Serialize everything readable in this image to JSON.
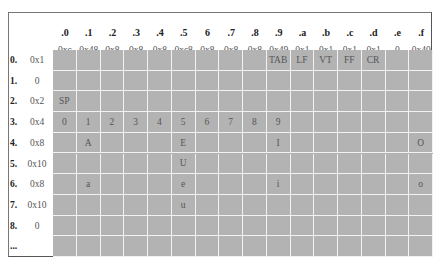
{
  "table": {
    "col_headers": [
      ".0",
      ".1",
      ".2",
      ".3",
      ".4",
      ".5",
      "6",
      ".7",
      ".8",
      ".9",
      ".a",
      ".b",
      ".c",
      ".d",
      ".e",
      ".f"
    ],
    "col_values": [
      "0xc",
      "0x48",
      "0x8",
      "0x8",
      "0x8",
      "0xc8",
      "0x8",
      "0x8",
      "0x8",
      "0x49",
      "0x1",
      "0x1",
      "0x1",
      "0x1",
      "0",
      "0x40"
    ],
    "rows": [
      {
        "index": "0.",
        "value": "0x1",
        "cells": [
          "",
          "",
          "",
          "",
          "",
          "",
          "",
          "",
          "",
          "TAB",
          "LF",
          "VT",
          "FF",
          "CR",
          "",
          ""
        ]
      },
      {
        "index": "1.",
        "value": "0",
        "cells": [
          "",
          "",
          "",
          "",
          "",
          "",
          "",
          "",
          "",
          "",
          "",
          "",
          "",
          "",
          "",
          ""
        ]
      },
      {
        "index": "2.",
        "value": "0x2",
        "cells": [
          "SP",
          "",
          "",
          "",
          "",
          "",
          "",
          "",
          "",
          "",
          "",
          "",
          "",
          "",
          "",
          ""
        ]
      },
      {
        "index": "3.",
        "value": "0x4",
        "cells": [
          "0",
          "1",
          "2",
          "3",
          "4",
          "5",
          "6",
          "7",
          "8",
          "9",
          "",
          "",
          "",
          "",
          "",
          ""
        ]
      },
      {
        "index": "4.",
        "value": "0x8",
        "cells": [
          "",
          "A",
          "",
          "",
          "",
          "E",
          "",
          "",
          "",
          "I",
          "",
          "",
          "",
          "",
          "",
          "O"
        ]
      },
      {
        "index": "5.",
        "value": "0x10",
        "cells": [
          "",
          "",
          "",
          "",
          "",
          "U",
          "",
          "",
          "",
          "",
          "",
          "",
          "",
          "",
          "",
          ""
        ]
      },
      {
        "index": "6.",
        "value": "0x8",
        "cells": [
          "",
          "a",
          "",
          "",
          "",
          "e",
          "",
          "",
          "",
          "i",
          "",
          "",
          "",
          "",
          "",
          "o"
        ]
      },
      {
        "index": "7.",
        "value": "0x10",
        "cells": [
          "",
          "",
          "",
          "",
          "",
          "u",
          "",
          "",
          "",
          "",
          "",
          "",
          "",
          "",
          "",
          ""
        ]
      },
      {
        "index": "8.",
        "value": "0",
        "cells": [
          "",
          "",
          "",
          "",
          "",
          "",
          "",
          "",
          "",
          "",
          "",
          "",
          "",
          "",
          "",
          ""
        ]
      },
      {
        "index": "...",
        "value": "",
        "cells": [
          "",
          "",
          "",
          "",
          "",
          "",
          "",
          "",
          "",
          "",
          "",
          "",
          "",
          "",
          "",
          ""
        ]
      }
    ]
  },
  "colors": {
    "cell_fill": "#b3b3b3",
    "grid_line": "#f2f2f2",
    "border": "#666666"
  }
}
